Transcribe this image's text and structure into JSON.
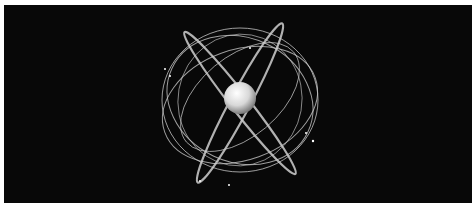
{
  "image": {
    "subject": "satellite constellation orbits around Earth",
    "background_color": "#080808",
    "orbit_color": "#cfcfcf",
    "globe_color": "#e8e8e8"
  }
}
